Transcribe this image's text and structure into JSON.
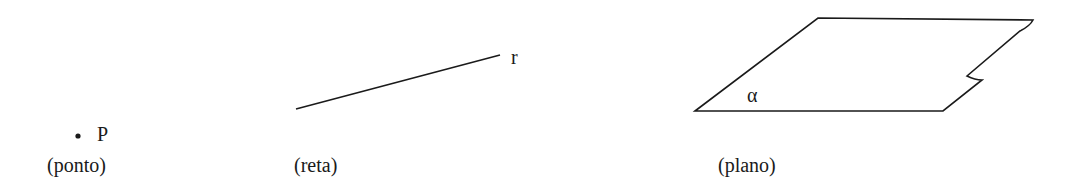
{
  "figures": [
    {
      "id": "ponto",
      "symbol": "P",
      "caption": "(ponto)"
    },
    {
      "id": "reta",
      "symbol": "r",
      "caption": "(reta)"
    },
    {
      "id": "plano",
      "symbol": "α",
      "caption": "(plano)"
    }
  ],
  "colors": {
    "ink": "#1a1a1a",
    "background": "#ffffff"
  }
}
